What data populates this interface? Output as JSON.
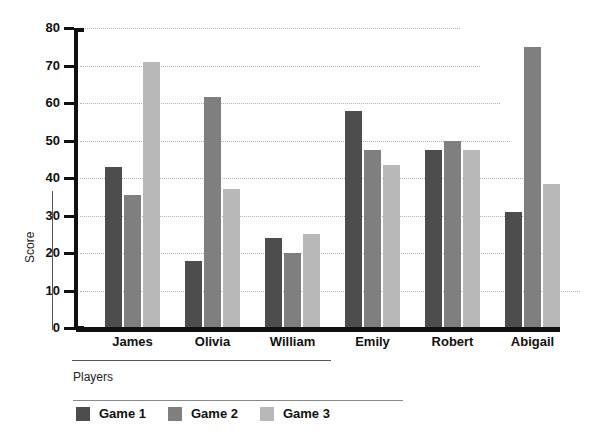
{
  "chart_data": {
    "type": "bar",
    "title": "",
    "xlabel": "Players",
    "ylabel": "Score",
    "categories": [
      "James",
      "Olivia",
      "William",
      "Emily",
      "Robert",
      "Abigail"
    ],
    "series": [
      {
        "name": "Game 1",
        "color": "#4d4d4d",
        "values": [
          43,
          18,
          24,
          58,
          47.5,
          31
        ]
      },
      {
        "name": "Game 2",
        "color": "#7f7f7f",
        "values": [
          35.5,
          61.5,
          20,
          47.5,
          50,
          75
        ]
      },
      {
        "name": "Game 3",
        "color": "#b8b8b8",
        "values": [
          71,
          37,
          25,
          43.5,
          47.5,
          38.5
        ]
      }
    ],
    "ylim": [
      0,
      80
    ],
    "yticks": [
      0,
      10,
      20,
      30,
      40,
      50,
      60,
      70,
      80
    ],
    "ytick_labels": [
      "0",
      "10",
      "20",
      "30",
      "40",
      "50",
      "60",
      "70",
      "80"
    ],
    "grid": true,
    "grid_style": "dotted",
    "legend_position": "bottom-left",
    "axis_color": "#111111",
    "background": "#ffffff"
  }
}
